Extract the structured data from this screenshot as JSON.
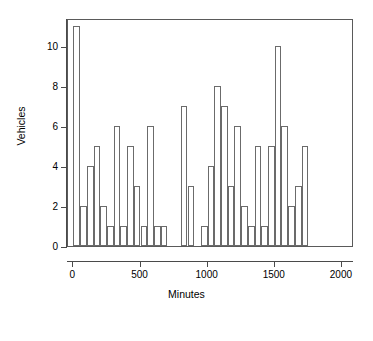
{
  "chart_data": {
    "type": "bar",
    "title": "",
    "subtitle": "",
    "xlabel": "Minutes",
    "ylabel": "Vehicles",
    "xlim": [
      -40,
      2090
    ],
    "ylim": [
      0,
      11.4
    ],
    "grid": false,
    "legend": null,
    "bin_width": 50,
    "x_ticks": [
      0,
      500,
      1000,
      1500,
      2000
    ],
    "x_tick_labels": [
      "0",
      "500",
      "1000",
      "1500",
      "2000"
    ],
    "y_ticks": [
      0,
      2,
      4,
      6,
      8,
      10
    ],
    "y_tick_labels": [
      "0",
      "2",
      "4",
      "6",
      "8",
      "10"
    ],
    "bin_starts": [
      0,
      50,
      100,
      150,
      200,
      250,
      300,
      350,
      400,
      450,
      500,
      550,
      600,
      650,
      700,
      750,
      800,
      850,
      900,
      950,
      1000,
      1050,
      1100,
      1150,
      1200,
      1250,
      1300,
      1350,
      1400,
      1450,
      1500,
      1550,
      1600,
      1650,
      1700,
      1750,
      1800,
      1850,
      1900,
      1950,
      2000
    ],
    "values": [
      11,
      2,
      4,
      5,
      2,
      1,
      6,
      1,
      5,
      3,
      1,
      6,
      1,
      1,
      0,
      0,
      7,
      3,
      0,
      1,
      4,
      8,
      7,
      3,
      6,
      2,
      1,
      5,
      1,
      5,
      10,
      6,
      2,
      3,
      5,
      0,
      0,
      0,
      0,
      0,
      0
    ],
    "bar_line_color": "#6b6b6b",
    "bar_fill_color": "#ffffff",
    "axis_color": "#4a4a4a"
  }
}
